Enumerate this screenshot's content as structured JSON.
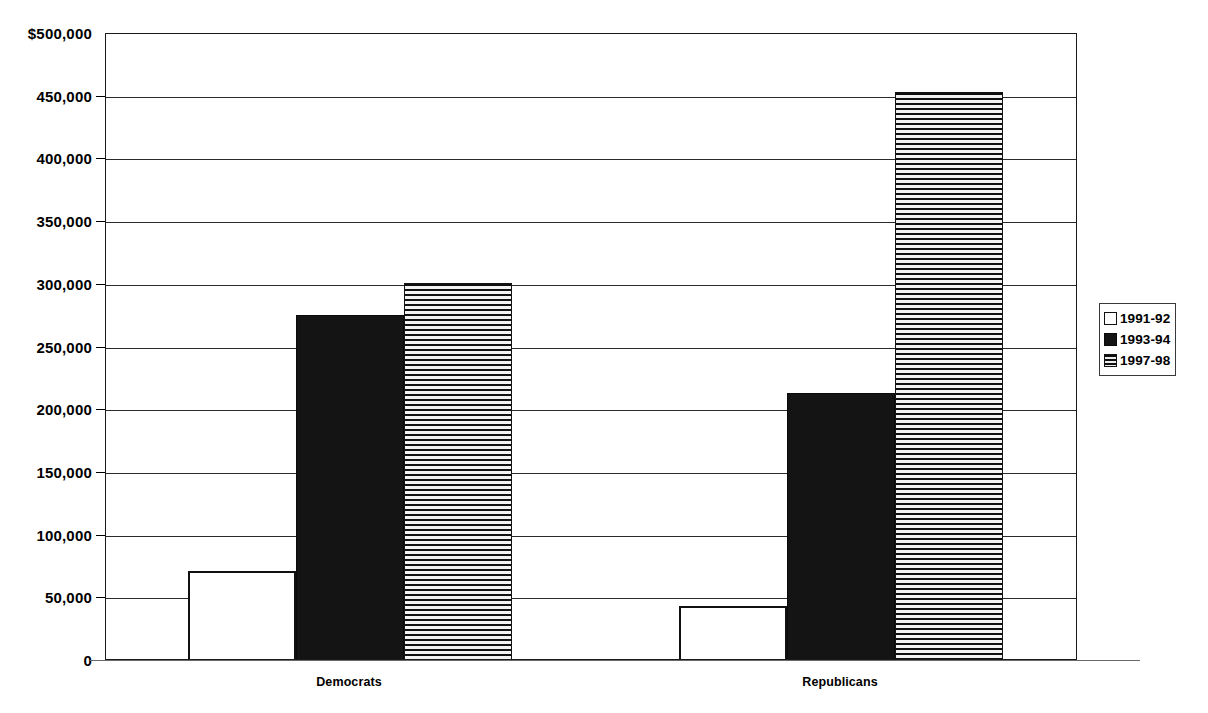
{
  "chart_data": {
    "type": "bar",
    "title": "",
    "subtitle": "",
    "xlabel": "",
    "ylabel": "",
    "categories": [
      "Democrats",
      "Republicans"
    ],
    "series": [
      {
        "name": "1991-92",
        "values": [
          70000,
          42000
        ],
        "fill": "empty"
      },
      {
        "name": "1993-94",
        "values": [
          274000,
          212000
        ],
        "fill": "solid"
      },
      {
        "name": "1997-98",
        "values": [
          300000,
          452000
        ],
        "fill": "striped"
      }
    ],
    "ylim": [
      0,
      500000
    ],
    "ytick_values": [
      0,
      50000,
      100000,
      150000,
      200000,
      250000,
      300000,
      350000,
      400000,
      450000,
      500000
    ],
    "ytick_labels": [
      "0",
      "50,000",
      "100,000",
      "150,000",
      "200,000",
      "250,000",
      "300,000",
      "350,000",
      "400,000",
      "450,000",
      "$500,000"
    ],
    "grid": true,
    "grid_axis": "y",
    "legend_position": "right",
    "orientation": "vertical",
    "colors": {
      "series_1_fill": "#ffffff",
      "series_1_stroke": "#111111",
      "series_2_fill": "#141414",
      "series_3_stripe_dark": "#101010",
      "series_3_stripe_light": "#f2f2f2",
      "axis": "#1a1a1a",
      "gridline": "#2b2b2b",
      "text": "#000000",
      "background": "#ffffff"
    }
  },
  "legend": {
    "items": [
      {
        "label": "1991-92",
        "fill": "empty"
      },
      {
        "label": "1993-94",
        "fill": "solid"
      },
      {
        "label": "1997-98",
        "fill": "striped"
      }
    ]
  },
  "axes": {
    "y_top_label": "$500,000",
    "x_categories": [
      "Democrats",
      "Republicans"
    ]
  }
}
